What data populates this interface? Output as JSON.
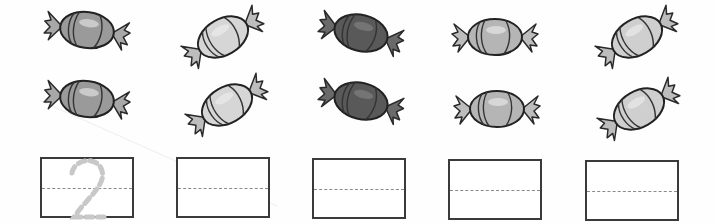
{
  "worksheet": {
    "columns": [
      {
        "shade": "#9a9a9a",
        "wrapper": "#a8a8a8",
        "style": "medium",
        "angle": 8,
        "candies": 2,
        "trace_digit": "2"
      },
      {
        "shade": "#d6d6d6",
        "wrapper": "#bdbdbd",
        "style": "light",
        "angle": -30,
        "candies": 2,
        "trace_digit": ""
      },
      {
        "shade": "#595959",
        "wrapper": "#6a6a6a",
        "style": "dark",
        "angle": 14,
        "candies": 2,
        "trace_digit": ""
      },
      {
        "shade": "#b5b5b5",
        "wrapper": "#bdbdbd",
        "style": "light-medium",
        "angle": 0,
        "candies": 2,
        "trace_digit": ""
      },
      {
        "shade": "#cfcfcf",
        "wrapper": "#bdbdbd",
        "style": "light",
        "angle": -30,
        "candies": 2,
        "trace_digit": ""
      }
    ],
    "trace_color": "#c8c8c8",
    "box_border_color": "#3a3a3a",
    "midline_color": "#8a8a8a"
  }
}
